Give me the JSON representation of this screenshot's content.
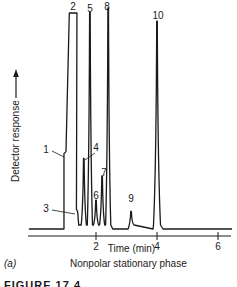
{
  "chart_data": {
    "type": "line",
    "title": "",
    "subtitle": "Nonpolar stationary phase",
    "panel_label": "(a)",
    "xlabel": "Time (min)",
    "ylabel": "Detector response",
    "ylabel_arrow": true,
    "xlim": [
      -0.2,
      6.4
    ],
    "x_ticks": [
      2,
      4,
      6
    ],
    "x_tick_labels": [
      "2",
      "4",
      "6"
    ],
    "grid": false,
    "legend": null,
    "baseline_start_min": -0.2,
    "solvent_front_min": 0.95,
    "peaks": [
      {
        "label": "1",
        "time_min": 1.0,
        "relative_height": 0.35,
        "kind": "shoulder"
      },
      {
        "label": "2",
        "time_min": 1.25,
        "relative_height": 1.0,
        "kind": "off-scale",
        "width_min": 0.25
      },
      {
        "label": "3",
        "time_min": 1.4,
        "relative_height": 0.09,
        "kind": "shoulder"
      },
      {
        "label": "4",
        "time_min": 1.6,
        "relative_height": 0.32
      },
      {
        "label": "5",
        "time_min": 1.8,
        "relative_height": 0.98
      },
      {
        "label": "6",
        "time_min": 2.0,
        "relative_height": 0.13
      },
      {
        "label": "7",
        "time_min": 2.2,
        "relative_height": 0.24
      },
      {
        "label": "8",
        "time_min": 2.4,
        "relative_height": 1.0
      },
      {
        "label": "9",
        "time_min": 3.15,
        "relative_height": 0.08
      },
      {
        "label": "10",
        "time_min": 4.0,
        "relative_height": 0.94
      }
    ]
  },
  "captions": {
    "xlabel": "Time (min)",
    "ylabel": "Detector response",
    "panel": "(a)",
    "panel_title": "Nonpolar stationary phase",
    "figure_caption_partial": "FIGURE 17.4"
  },
  "colors": {
    "trace": "#1a1a1a",
    "background": "#ffffff"
  }
}
